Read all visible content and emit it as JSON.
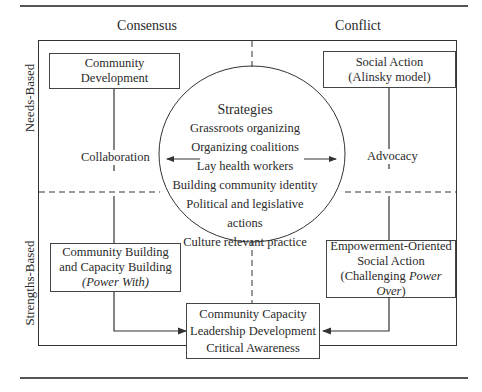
{
  "columns": {
    "left": "Consensus",
    "right": "Conflict"
  },
  "rows": {
    "top": "Needs-Based",
    "bottom": "Strengths-Based"
  },
  "boxes": {
    "top_left": {
      "lines": [
        "Community",
        "Development"
      ]
    },
    "top_right": {
      "lines": [
        "Social Action",
        "(Alinsky model)"
      ]
    },
    "bottom_left": {
      "lines": [
        "Community Building",
        "and Capacity Building"
      ],
      "italic_line": "(Power With)"
    },
    "bottom_right": {
      "lines": [
        "Empowerment-Oriented",
        "Social Action"
      ],
      "line3_prefix": "(Challenging ",
      "line3_italic": "Power Over",
      "line3_suffix": ")"
    },
    "center_bottom": {
      "lines": [
        "Community Capacity",
        "Leadership Development",
        "Critical Awareness"
      ]
    }
  },
  "labels": {
    "left_arrow": "Collaboration",
    "right_arrow": "Advocacy"
  },
  "strategies": {
    "title": "Strategies",
    "items": [
      "Grassroots organizing",
      "Organizing coalitions",
      "Lay health workers",
      "Building community identity",
      "Political and legislative actions",
      "Culture relevant practice"
    ]
  }
}
